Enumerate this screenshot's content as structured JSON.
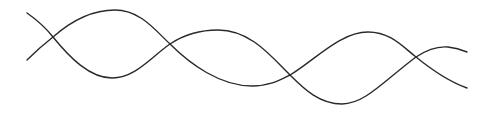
{
  "figure": {
    "background": "#ffffff",
    "stroke_color": "#2a2a2a",
    "stroke_width": 1.4,
    "curves": [
      {
        "id": "curve-a",
        "path": "M27,13 C37,20 46,28 53,37 C70,58 90,78 112,78 C135,78 150,58 170,44 C185,34 200,30 218,30 C250,30 270,55 290,75 C305,90 320,104 342,104 C365,104 385,80 416,57 C428,49 437,46 448,47 C456,48 462,50 467,52"
      },
      {
        "id": "curve-b",
        "path": "M27,60 C35,52 44,44 53,37 C70,22 90,10 115,10 C140,10 155,30 170,44 C190,64 220,86 252,86 C270,86 280,80 290,75 C315,60 340,32 368,32 C390,32 402,46 416,57 C432,70 450,82 467,88"
      }
    ],
    "crossings": [
      {
        "x": 53,
        "y": 37
      },
      {
        "x": 170,
        "y": 44
      },
      {
        "x": 290,
        "y": 75
      },
      {
        "x": 416,
        "y": 57
      }
    ]
  }
}
